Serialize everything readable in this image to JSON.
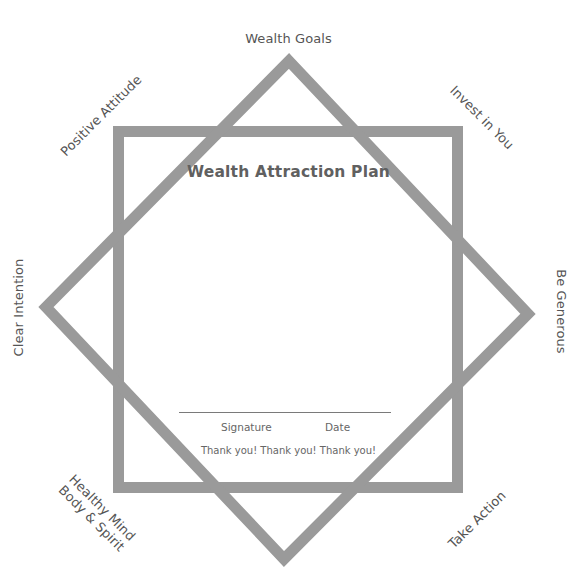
{
  "diagram": {
    "title": "Wealth Attraction Plan",
    "stroke_color": "#9a9a9a",
    "square": {
      "x": 113,
      "y": 126,
      "w": 350,
      "h": 367,
      "stroke_width": 11
    },
    "diamond": {
      "points": [
        [
          289,
          53
        ],
        [
          536,
          314
        ],
        [
          284,
          567
        ],
        [
          38,
          307
        ]
      ],
      "stroke_width": 11
    },
    "star_points": [
      {
        "label": "Wealth Goals",
        "position": "top"
      },
      {
        "label": "Invest in You",
        "position": "top-right"
      },
      {
        "label": "Be Generous",
        "position": "right"
      },
      {
        "label": "Take Action",
        "position": "bottom-right"
      },
      {
        "label": "Healthy Mind",
        "label2": "Body & Spirit",
        "position": "bottom-left"
      },
      {
        "label": "Clear Intention",
        "position": "left"
      },
      {
        "label": "Positive Attitude",
        "position": "top-left"
      }
    ],
    "signature_block": {
      "signature_label": "Signature",
      "date_label": "Date",
      "footer": "Thank you! Thank you! Thank you!"
    }
  }
}
